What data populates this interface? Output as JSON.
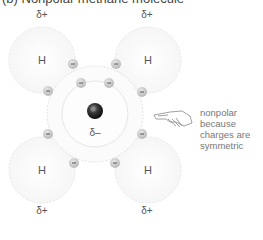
{
  "figure": {
    "title": "(b) Nonpolar methane molecule",
    "hydrogen_symbol": "H",
    "hydrogen_charge": "δ+",
    "carbon_charge": "δ–",
    "electron_symbol": "–",
    "annotation_lines": [
      "nonpolar",
      "because",
      "charges are",
      "symmetric"
    ],
    "pointer_icon": "pointing-hand-icon",
    "colors": {
      "shell": "#e3e3e3",
      "electron_fill": "#c9c9c9",
      "carbon": "#2b2b2b",
      "text": "#555555"
    }
  }
}
